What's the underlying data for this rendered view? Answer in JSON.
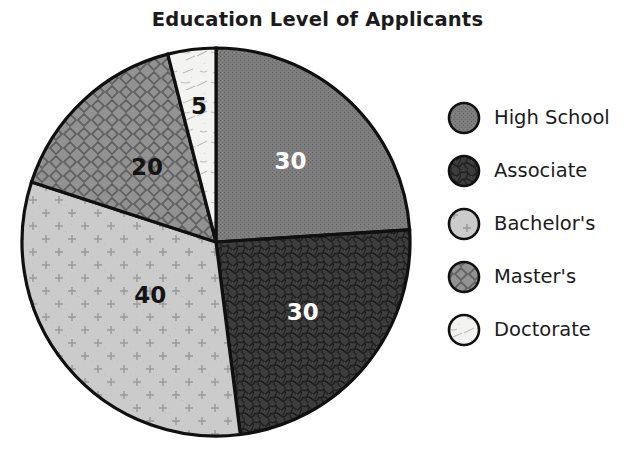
{
  "chart_data": {
    "type": "pie",
    "title": "Education Level of Applicants",
    "xlabel": "",
    "ylabel": "",
    "grid": false,
    "legend_position": "right",
    "total": 125,
    "start_angle_deg": 0,
    "direction": "clockwise",
    "categories": [
      "High School",
      "Associate",
      "Bachelor's",
      "Master's",
      "Doctorate"
    ],
    "values": [
      30,
      30,
      40,
      20,
      5
    ],
    "labels": [
      "30",
      "30",
      "40",
      "20",
      "5"
    ],
    "slices": [
      {
        "name": "High School",
        "value": 30,
        "label": "30",
        "fill": "#777777",
        "pattern": "dense-stipple",
        "label_color": "#ffffff",
        "start_deg": 0,
        "end_deg": 86.4
      },
      {
        "name": "Associate",
        "value": 30,
        "label": "30",
        "fill": "#3f3f3f",
        "pattern": "mottled-squiggle",
        "label_color": "#ffffff",
        "start_deg": 86.4,
        "end_deg": 172.8
      },
      {
        "name": "Bachelor's",
        "value": 40,
        "label": "40",
        "fill": "#c9c9c9",
        "pattern": "sparse-crosses",
        "label_color": "#141414",
        "start_deg": 172.8,
        "end_deg": 288.0
      },
      {
        "name": "Master's",
        "value": 20,
        "label": "20",
        "fill": "#8f8f8f",
        "pattern": "diagonal-crosshatch",
        "label_color": "#141414",
        "start_deg": 288.0,
        "end_deg": 345.6
      },
      {
        "name": "Doctorate",
        "value": 5,
        "label": "5",
        "fill": "#f2f2f0",
        "pattern": "faint-scratches",
        "label_color": "#141414",
        "start_deg": 345.6,
        "end_deg": 360.0
      }
    ],
    "colors": {
      "high_school": "#777777",
      "associate": "#3f3f3f",
      "bachelors": "#c9c9c9",
      "masters": "#8f8f8f",
      "doctorate": "#f2f2f0",
      "outline": "#101010",
      "text": "#1b1b1b",
      "background": "#ffffff"
    }
  },
  "legend": {
    "items": [
      {
        "label": "High School",
        "swatch_icon": "circle-swatch-dense-stipple"
      },
      {
        "label": "Associate",
        "swatch_icon": "circle-swatch-mottled-squiggle"
      },
      {
        "label": "Bachelor's",
        "swatch_icon": "circle-swatch-sparse-crosses"
      },
      {
        "label": "Master's",
        "swatch_icon": "circle-swatch-diagonal-crosshatch"
      },
      {
        "label": "Doctorate",
        "swatch_icon": "circle-swatch-faint-scratches"
      }
    ]
  }
}
